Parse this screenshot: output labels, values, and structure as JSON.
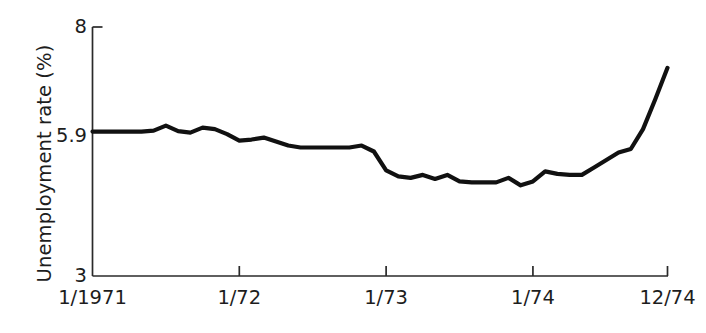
{
  "chart_data": {
    "type": "line",
    "title": "",
    "xlabel": "",
    "ylabel": "Unemployment rate (%)",
    "ylim": [
      3,
      8
    ],
    "xlim": [
      "1/1971",
      "12/74"
    ],
    "grid": false,
    "legend": null,
    "y_ticks": [
      {
        "value": 8,
        "label": "8"
      },
      {
        "value": 5.9,
        "label": "5.9"
      },
      {
        "value": 3,
        "label": "3"
      }
    ],
    "x_ticks": [
      {
        "index": 0,
        "label": "1/1971"
      },
      {
        "index": 12,
        "label": "1/72"
      },
      {
        "index": 24,
        "label": "1/73"
      },
      {
        "index": 36,
        "label": "1/74"
      },
      {
        "index": 47,
        "label": "12/74"
      }
    ],
    "x": [
      "1/1971",
      "2/1971",
      "3/1971",
      "4/1971",
      "5/1971",
      "6/1971",
      "7/1971",
      "8/1971",
      "9/1971",
      "10/1971",
      "11/1971",
      "12/1971",
      "1/72",
      "2/72",
      "3/72",
      "4/72",
      "5/72",
      "6/72",
      "7/72",
      "8/72",
      "9/72",
      "10/72",
      "11/72",
      "12/72",
      "1/73",
      "2/73",
      "3/73",
      "4/73",
      "5/73",
      "6/73",
      "7/73",
      "8/73",
      "9/73",
      "10/73",
      "11/73",
      "12/73",
      "1/74",
      "2/74",
      "3/74",
      "4/74",
      "5/74",
      "6/74",
      "7/74",
      "8/74",
      "9/74",
      "10/74",
      "11/74",
      "12/74"
    ],
    "series": [
      {
        "name": "Unemployment rate",
        "color": "#111111",
        "values": [
          5.9,
          5.9,
          5.9,
          5.9,
          5.9,
          5.92,
          6.02,
          5.91,
          5.88,
          5.98,
          5.95,
          5.85,
          5.72,
          5.74,
          5.78,
          5.7,
          5.62,
          5.58,
          5.58,
          5.58,
          5.58,
          5.58,
          5.62,
          5.5,
          5.12,
          5.0,
          4.97,
          5.03,
          4.95,
          5.03,
          4.9,
          4.88,
          4.88,
          4.88,
          4.97,
          4.82,
          4.9,
          5.1,
          5.05,
          5.03,
          5.03,
          5.18,
          5.33,
          5.48,
          5.55,
          5.95,
          6.55,
          7.18
        ]
      }
    ],
    "axis": {
      "y_value_top": 8,
      "y_value_bottom": 3,
      "n_points": 48
    }
  },
  "figure": {
    "ylabel_text": "Unemployment rate (%)"
  }
}
